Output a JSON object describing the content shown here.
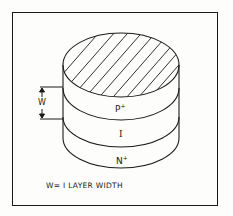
{
  "diagram": {
    "layers": [
      {
        "name": "p_plus",
        "label": "P",
        "superscript": "+"
      },
      {
        "name": "intrinsic",
        "label": "I"
      },
      {
        "name": "n_plus",
        "label": "N",
        "superscript": "+"
      }
    ],
    "dimension": {
      "label": "W"
    },
    "caption": "W= I LAYER WIDTH",
    "colors": {
      "line": "#1a1a1a",
      "background": "#fdfdfb"
    }
  }
}
